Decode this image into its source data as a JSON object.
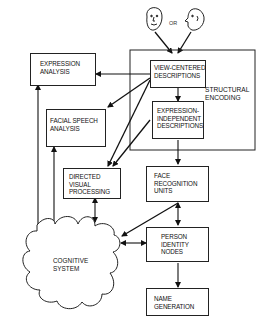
{
  "diagram": {
    "inputs": {
      "or_label": "OR",
      "faces": [
        "front-face-icon",
        "profile-face-icon"
      ]
    },
    "structural_encoding": {
      "label": [
        "STRUCTURAL",
        "ENCODING"
      ],
      "view_centered": [
        "VIEW-CENTERED",
        "DESCRIPTIONS"
      ],
      "expression_independent": [
        "EXPRESSION-",
        "INDEPENDENT",
        "DESCRIPTIONS"
      ]
    },
    "expression_analysis": [
      "EXPRESSION",
      "ANALYSIS"
    ],
    "facial_speech_analysis": [
      "FACIAL SPEECH",
      "ANALYSIS"
    ],
    "directed_visual_processing": [
      "DIRECTED",
      "VISUAL",
      "PROCESSING"
    ],
    "face_recognition_units": [
      "FACE",
      "RECOGNITION",
      "UNITS"
    ],
    "person_identity_nodes": [
      "PERSON",
      "IDENTITY",
      "NODES"
    ],
    "name_generation": [
      "NAME",
      "GENERATION"
    ],
    "cognitive_system": [
      "COGNITIVE",
      "SYSTEM"
    ],
    "colors": {
      "stroke": "#222222",
      "background": "#ffffff"
    }
  }
}
